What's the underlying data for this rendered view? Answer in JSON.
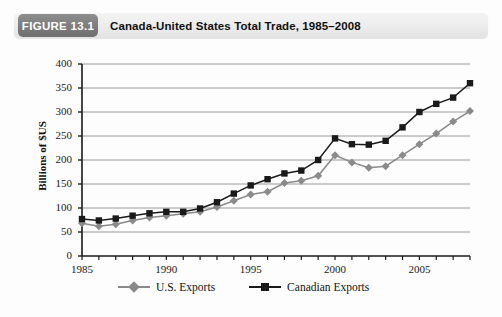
{
  "header": {
    "badge": "FIGURE 13.1",
    "title": "Canada-United States Total Trade, 1985–2008"
  },
  "colors": {
    "badge_bg": "#7e7e7e",
    "header_bg": "#ededed",
    "us_exports": "#8a8a8a",
    "canadian_exports": "#1a1a1a",
    "gridline": "#9a9a9a",
    "axis": "#1a1a1a"
  },
  "legend": {
    "position": "bottom",
    "items": [
      {
        "label": "U.S. Exports",
        "marker": "diamond-marker-icon",
        "color": "#8a8a8a"
      },
      {
        "label": "Canadian Exports",
        "marker": "square-marker-icon",
        "color": "#1a1a1a"
      }
    ]
  },
  "chart_data": {
    "type": "line",
    "title": "Canada-United States Total Trade, 1985–2008",
    "subtitle": "",
    "xlabel": "",
    "ylabel": "Billions of $US",
    "xlim": [
      1985,
      2008
    ],
    "ylim": [
      0,
      400
    ],
    "yticks": [
      0,
      50,
      100,
      150,
      200,
      250,
      300,
      350,
      400
    ],
    "ytick_labels": [
      "0",
      "50",
      "100",
      "150",
      "200",
      "250",
      "300",
      "350",
      "400"
    ],
    "xticks": [
      1985,
      1986,
      1987,
      1988,
      1989,
      1990,
      1991,
      1992,
      1993,
      1994,
      1995,
      1996,
      1997,
      1998,
      1999,
      2000,
      2001,
      2002,
      2003,
      2004,
      2005,
      2006,
      2007,
      2008
    ],
    "xtick_labels_shown": [
      "1985",
      "1990",
      "1995",
      "2000",
      "2005"
    ],
    "xtick_labels_shown_values": [
      1985,
      1990,
      1995,
      2000,
      2005
    ],
    "grid": true,
    "grid_axis": "y",
    "x": [
      1985,
      1986,
      1987,
      1988,
      1989,
      1990,
      1991,
      1992,
      1993,
      1994,
      1995,
      1996,
      1997,
      1998,
      1999,
      2000,
      2001,
      2002,
      2003,
      2004,
      2005,
      2006,
      2007,
      2008
    ],
    "series": [
      {
        "name": "U.S. Exports",
        "marker": "diamond",
        "color": "#8a8a8a",
        "values": [
          68,
          62,
          66,
          74,
          80,
          84,
          88,
          92,
          102,
          115,
          128,
          134,
          152,
          157,
          167,
          210,
          195,
          184,
          187,
          210,
          233,
          255,
          280,
          302
        ]
      },
      {
        "name": "Canadian Exports",
        "marker": "square",
        "color": "#1a1a1a",
        "values": [
          77,
          74,
          78,
          84,
          89,
          92,
          92,
          99,
          112,
          130,
          147,
          160,
          172,
          178,
          200,
          245,
          233,
          232,
          240,
          268,
          300,
          317,
          330,
          360
        ]
      }
    ]
  }
}
